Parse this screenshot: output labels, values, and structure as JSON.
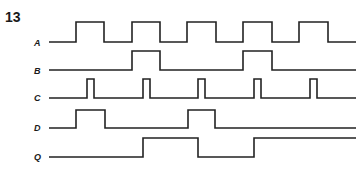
{
  "figure": {
    "number": "13",
    "type": "timing-diagram",
    "line_color": "#222222",
    "x_start": 49,
    "x_end": 356
  },
  "signals": [
    {
      "name": "A",
      "label": "A",
      "label_top": 38,
      "y_high": 22,
      "y_low": 42,
      "initial": 0,
      "transitions": [
        76,
        104,
        132,
        160,
        187,
        216,
        243,
        272,
        299,
        328
      ]
    },
    {
      "name": "B",
      "label": "B",
      "label_top": 66,
      "y_high": 51,
      "y_low": 70,
      "initial": 0,
      "transitions": [
        132,
        160,
        243,
        272
      ]
    },
    {
      "name": "C",
      "label": "C",
      "label_top": 93,
      "y_high": 79,
      "y_low": 98,
      "initial": 0,
      "transitions": [
        87,
        94,
        143,
        150,
        198,
        205,
        254,
        261,
        310,
        317
      ]
    },
    {
      "name": "D",
      "label": "D",
      "label_top": 123,
      "y_high": 110,
      "y_low": 128,
      "initial": 0,
      "transitions": [
        76,
        105,
        188,
        215
      ]
    },
    {
      "name": "Q",
      "label": "Q",
      "label_top": 152,
      "y_high": 138,
      "y_low": 157,
      "initial": 0,
      "transitions": [
        143,
        198,
        254
      ]
    }
  ]
}
